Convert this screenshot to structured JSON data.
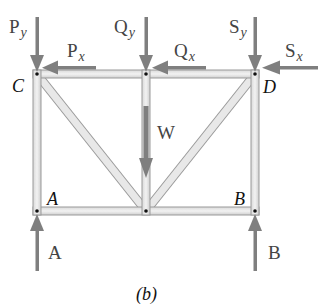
{
  "diagram": {
    "caption": "(b)",
    "joints": {
      "C": "C",
      "D": "D",
      "A": "A",
      "B": "B"
    },
    "forces": {
      "Py": {
        "base": "P",
        "sub": "y"
      },
      "Px": {
        "base": "P",
        "sub": "x"
      },
      "Qy": {
        "base": "Q",
        "sub": "y"
      },
      "Qx": {
        "base": "Q",
        "sub": "x"
      },
      "Sy": {
        "base": "S",
        "sub": "y"
      },
      "Sx": {
        "base": "S",
        "sub": "x"
      },
      "W": {
        "base": "W"
      },
      "A": {
        "base": "A"
      },
      "B": {
        "base": "B"
      }
    },
    "colors": {
      "member_fill": "#e6e6e6",
      "member_edge": "#9a9a9a",
      "arrow": "#7f7f7f",
      "pin": "#111111"
    }
  }
}
